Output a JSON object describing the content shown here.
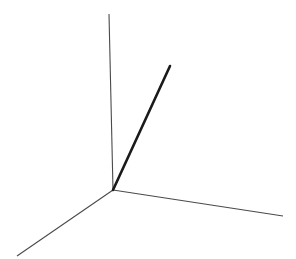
{
  "canvas": {
    "width": 296,
    "height": 259,
    "background_color": "#ffffff"
  },
  "figure": {
    "title": "",
    "kind": "3d-axis-triad-with-vector"
  },
  "colors": {
    "axis_stroke": "#4a4a4a",
    "vector_stroke": "#1a1a1a",
    "background": "#ffffff"
  },
  "chart_data": {
    "type": "scatter",
    "title": "",
    "subtitle": "",
    "xlabel": "",
    "ylabel": "",
    "grid": false,
    "legend": "none",
    "projection": "3d-axonometric",
    "origin": {
      "x": 113,
      "y": 190
    },
    "series": [
      {
        "name": "z-axis",
        "role": "axis",
        "x": [
          113,
          109
        ],
        "y": [
          190,
          14
        ],
        "stroke": "#4a4a4a",
        "width": 1.1
      },
      {
        "name": "y-axis",
        "role": "axis",
        "x": [
          113,
          283
        ],
        "y": [
          190,
          216
        ],
        "stroke": "#4a4a4a",
        "width": 1.1
      },
      {
        "name": "x-axis",
        "role": "axis",
        "x": [
          113,
          17
        ],
        "y": [
          190,
          256
        ],
        "stroke": "#4a4a4a",
        "width": 1.1
      },
      {
        "name": "vector",
        "role": "vector",
        "x": [
          113,
          170
        ],
        "y": [
          190,
          66
        ],
        "stroke": "#1a1a1a",
        "width": 2.6
      }
    ],
    "xlim": [
      0,
      296
    ],
    "ylim": [
      0,
      259
    ]
  },
  "annotations": {
    "labels": []
  }
}
